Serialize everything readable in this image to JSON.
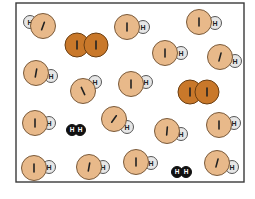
{
  "diagram": {
    "title": "",
    "frame": {
      "x": 16,
      "y": 3,
      "w": 228,
      "h": 179,
      "stroke": "#3a3a3a"
    },
    "colors": {
      "iodine_atom": "#e8b98a",
      "iodine_atom_stroke": "#7a5a3a",
      "hydrogen_atom": "#e6e6e6",
      "hydrogen_atom_stroke": "#555555",
      "i2_atom": "#c9782a",
      "i2_atom_stroke": "#6a3e12",
      "h2_atom": "#111111",
      "label_dark": "#222222",
      "label_light": "#ffffff"
    },
    "labels": {
      "iodine": "I",
      "hydrogen": "H"
    },
    "molecules": [
      {
        "type": "HI",
        "i": [
          43,
          26
        ],
        "h": [
          30,
          22
        ],
        "tilt": 20
      },
      {
        "type": "I2",
        "a": [
          77,
          45
        ],
        "b": [
          96,
          45
        ]
      },
      {
        "type": "HI",
        "i": [
          127,
          27
        ],
        "h": [
          143,
          27
        ],
        "tilt": 0
      },
      {
        "type": "HI",
        "i": [
          199,
          22
        ],
        "h": [
          215,
          23
        ],
        "tilt": 0
      },
      {
        "type": "HI",
        "i": [
          165,
          53
        ],
        "h": [
          181,
          53
        ],
        "tilt": 0
      },
      {
        "type": "HI",
        "i": [
          220,
          57
        ],
        "h": [
          235,
          61
        ],
        "tilt": 15
      },
      {
        "type": "HI",
        "i": [
          36,
          73
        ],
        "h": [
          51,
          76
        ],
        "tilt": 10
      },
      {
        "type": "HI",
        "i": [
          83,
          91
        ],
        "h": [
          95,
          82
        ],
        "tilt": -25
      },
      {
        "type": "HI",
        "i": [
          131,
          84
        ],
        "h": [
          146,
          82
        ],
        "tilt": 0
      },
      {
        "type": "I2",
        "a": [
          190,
          92
        ],
        "b": [
          207,
          92
        ]
      },
      {
        "type": "HI",
        "i": [
          35,
          123
        ],
        "h": [
          49,
          123
        ],
        "tilt": 0
      },
      {
        "type": "H2",
        "a": [
          72,
          130
        ],
        "b": [
          80,
          130
        ]
      },
      {
        "type": "HI",
        "i": [
          114,
          119
        ],
        "h": [
          127,
          127
        ],
        "tilt": 35
      },
      {
        "type": "HI",
        "i": [
          167,
          131
        ],
        "h": [
          181,
          134
        ],
        "tilt": 5
      },
      {
        "type": "HI",
        "i": [
          219,
          125
        ],
        "h": [
          234,
          123
        ],
        "tilt": 0
      },
      {
        "type": "HI",
        "i": [
          34,
          168
        ],
        "h": [
          49,
          167
        ],
        "tilt": 0
      },
      {
        "type": "HI",
        "i": [
          89,
          167
        ],
        "h": [
          103,
          167
        ],
        "tilt": 10
      },
      {
        "type": "HI",
        "i": [
          136,
          162
        ],
        "h": [
          151,
          163
        ],
        "tilt": 0
      },
      {
        "type": "H2",
        "a": [
          177,
          172
        ],
        "b": [
          186,
          172
        ]
      },
      {
        "type": "HI",
        "i": [
          217,
          163
        ],
        "h": [
          232,
          167
        ],
        "tilt": 15
      }
    ]
  }
}
